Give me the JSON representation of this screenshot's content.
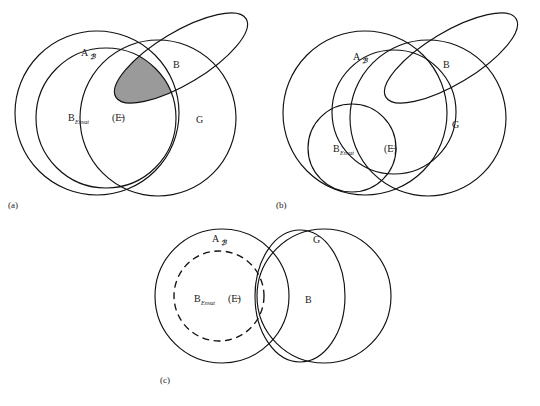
{
  "figure": {
    "background_color": "#ffffff",
    "stroke_color": "#111111",
    "shaded_region_color": "#9a9a9a"
  },
  "panels": [
    {
      "id": "a",
      "caption": "(a)",
      "labels": {
        "a_set": "A",
        "a_set_sub": "ℬ",
        "b_envat": "B",
        "b_envat_sub": "Envat",
        "e_set": "(E̶)",
        "b_set": "B",
        "g_set": "G"
      },
      "shaded": true,
      "shaded_note": "intersection lens shaded grey"
    },
    {
      "id": "b",
      "caption": "(b)",
      "labels": {
        "a_set": "A",
        "a_set_sub": "ℬ",
        "b_envat": "B",
        "b_envat_sub": "Envat",
        "e_set": "(E̶)",
        "b_set": "B",
        "g_set": "G"
      },
      "shaded": false
    },
    {
      "id": "c",
      "caption": "(c)",
      "labels": {
        "a_set": "A",
        "a_set_sub": "ℬ",
        "b_envat": "B",
        "b_envat_sub": "Envat",
        "e_set": "(E̶)",
        "b_set": "B",
        "g_set": "G"
      },
      "shaded": false,
      "dashed_circle": "B_Envat (E)"
    }
  ]
}
